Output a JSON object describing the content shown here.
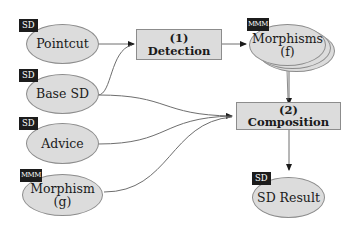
{
  "diagram": {
    "inputs": [
      {
        "id": "pointcut",
        "tag": "SD",
        "label": "Pointcut"
      },
      {
        "id": "base-sd",
        "tag": "SD",
        "label": "Base SD"
      },
      {
        "id": "advice",
        "tag": "SD",
        "label": "Advice"
      },
      {
        "id": "morphism-g",
        "tag": "MMM",
        "label_line1": "Morphism",
        "label_line2": "(g)"
      }
    ],
    "processes": [
      {
        "id": "detection",
        "label": "(1) Detection"
      },
      {
        "id": "composition",
        "label": "(2) Composition"
      }
    ],
    "intermediate": {
      "id": "morphisms-f",
      "tag": "MMM",
      "label_line1": "Morphisms",
      "label_line2": "(f)"
    },
    "output": {
      "id": "sd-result",
      "tag": "SD",
      "label": "SD Result"
    },
    "edges": [
      {
        "from": "pointcut",
        "to": "detection"
      },
      {
        "from": "base-sd",
        "to": "detection"
      },
      {
        "from": "detection",
        "to": "morphisms-f"
      },
      {
        "from": "morphisms-f",
        "to": "composition"
      },
      {
        "from": "base-sd",
        "to": "composition"
      },
      {
        "from": "advice",
        "to": "composition"
      },
      {
        "from": "morphism-g",
        "to": "composition"
      },
      {
        "from": "composition",
        "to": "sd-result"
      }
    ],
    "colors": {
      "node_fill": "#dcdcdc",
      "node_border": "#8c8c8c",
      "tag_fill": "#1c1c1c",
      "edge": "#6e6e6e"
    }
  }
}
